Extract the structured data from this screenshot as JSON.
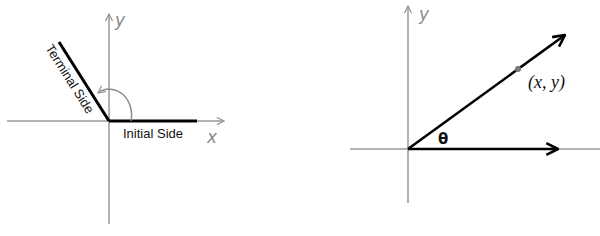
{
  "colors": {
    "axis": "#999999",
    "ray": "#000000",
    "point": "#777777",
    "background": "#ffffff"
  },
  "left_diagram": {
    "x_axis_label": "x",
    "y_axis_label": "y",
    "terminal_side_label": "Terminal Side",
    "initial_side_label": "Initial Side",
    "arc": "counterclockwise-rotation-arrow"
  },
  "right_diagram": {
    "x_axis_label": "",
    "y_axis_label": "y",
    "angle_label": "θ",
    "point_label": "(x, y)"
  }
}
